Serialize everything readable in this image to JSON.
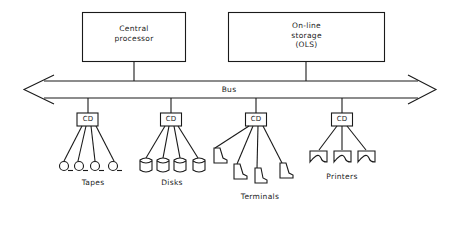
{
  "diagram": {
    "nodes": {
      "central_processor": {
        "label_line1": "Central",
        "label_line2": "processor"
      },
      "online_storage": {
        "label_line1": "On-line",
        "label_line2": "storage",
        "label_line3": "(OLS)"
      }
    },
    "bus": {
      "label": "Bus"
    },
    "controllers": [
      {
        "label": "CD",
        "device_group": "Tapes",
        "device_count": 4
      },
      {
        "label": "CD",
        "device_group": "Disks",
        "device_count": 4
      },
      {
        "label": "CD",
        "device_group": "Terminals",
        "device_count": 4
      },
      {
        "label": "CD",
        "device_group": "Printers",
        "device_count": 3
      }
    ],
    "colors": {
      "line": "#1a1a1a",
      "background": "#ffffff"
    }
  }
}
